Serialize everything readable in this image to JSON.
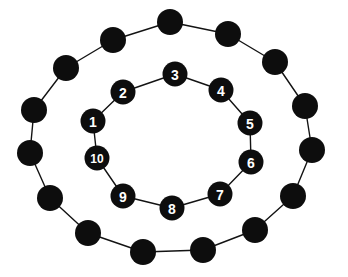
{
  "figure": {
    "background_color": "#ffffff",
    "node_color": "#0d0d0d",
    "edge_color": "#131313",
    "label_color": "#ffffff",
    "width": 348,
    "height": 277
  },
  "chart_data": {
    "type": "diagram",
    "subtype": "node-link-graph",
    "title": "",
    "rings": [
      {
        "name": "outer-ring",
        "node_count": 16,
        "labeled": false,
        "node_radius": 13,
        "center": [
          174,
          138
        ],
        "radius_x": 146,
        "radius_y": 118
      },
      {
        "name": "inner-ring",
        "node_count": 10,
        "labeled": true,
        "node_radius": 12.5,
        "center": [
          172,
          140
        ],
        "radius_x": 82,
        "radius_y": 68
      }
    ],
    "outer_nodes": [
      {
        "id": "o1",
        "label": "",
        "cx": 170,
        "cy": 22
      },
      {
        "id": "o2",
        "label": "",
        "cx": 228,
        "cy": 34
      },
      {
        "id": "o3",
        "label": "",
        "cx": 275,
        "cy": 62
      },
      {
        "id": "o4",
        "label": "",
        "cx": 305,
        "cy": 106
      },
      {
        "id": "o5",
        "label": "",
        "cx": 312,
        "cy": 150
      },
      {
        "id": "o6",
        "label": "",
        "cx": 293,
        "cy": 196
      },
      {
        "id": "o7",
        "label": "",
        "cx": 255,
        "cy": 230
      },
      {
        "id": "o8",
        "label": "",
        "cx": 203,
        "cy": 250
      },
      {
        "id": "o9",
        "label": "",
        "cx": 143,
        "cy": 252
      },
      {
        "id": "o10",
        "label": "",
        "cx": 88,
        "cy": 233
      },
      {
        "id": "o11",
        "label": "",
        "cx": 50,
        "cy": 198
      },
      {
        "id": "o12",
        "label": "",
        "cx": 30,
        "cy": 153
      },
      {
        "id": "o13",
        "label": "",
        "cx": 34,
        "cy": 110
      },
      {
        "id": "o14",
        "label": "",
        "cx": 66,
        "cy": 68
      },
      {
        "id": "o15",
        "label": "",
        "cx": 113,
        "cy": 40
      },
      {
        "id": "o16",
        "label": "",
        "cx": 170,
        "cy": 22
      }
    ],
    "inner_nodes": [
      {
        "id": "i1",
        "label": "1",
        "cx": 93,
        "cy": 121
      },
      {
        "id": "i2",
        "label": "2",
        "cx": 123,
        "cy": 92
      },
      {
        "id": "i3",
        "label": "3",
        "cx": 175,
        "cy": 74
      },
      {
        "id": "i4",
        "label": "4",
        "cx": 221,
        "cy": 90
      },
      {
        "id": "i5",
        "label": "5",
        "cx": 250,
        "cy": 123
      },
      {
        "id": "i6",
        "label": "6",
        "cx": 251,
        "cy": 162
      },
      {
        "id": "i7",
        "label": "7",
        "cx": 220,
        "cy": 194
      },
      {
        "id": "i8",
        "label": "8",
        "cx": 172,
        "cy": 208
      },
      {
        "id": "i9",
        "label": "9",
        "cx": 123,
        "cy": 196
      },
      {
        "id": "i10",
        "label": "10",
        "cx": 97,
        "cy": 158
      }
    ],
    "outer_edges": [
      [
        "o1",
        "o2"
      ],
      [
        "o2",
        "o3"
      ],
      [
        "o3",
        "o4"
      ],
      [
        "o4",
        "o5"
      ],
      [
        "o5",
        "o6"
      ],
      [
        "o6",
        "o7"
      ],
      [
        "o7",
        "o8"
      ],
      [
        "o8",
        "o9"
      ],
      [
        "o9",
        "o10"
      ],
      [
        "o10",
        "o11"
      ],
      [
        "o11",
        "o12"
      ],
      [
        "o12",
        "o13"
      ],
      [
        "o13",
        "o14"
      ],
      [
        "o14",
        "o15"
      ],
      [
        "o15",
        "o1"
      ]
    ],
    "inner_edges": [
      [
        "i1",
        "i2"
      ],
      [
        "i2",
        "i3"
      ],
      [
        "i3",
        "i4"
      ],
      [
        "i4",
        "i5"
      ],
      [
        "i5",
        "i6"
      ],
      [
        "i6",
        "i7"
      ],
      [
        "i7",
        "i8"
      ],
      [
        "i8",
        "i9"
      ],
      [
        "i9",
        "i10"
      ],
      [
        "i10",
        "i1"
      ]
    ],
    "inner_labels": [
      "1",
      "2",
      "3",
      "4",
      "5",
      "6",
      "7",
      "8",
      "9",
      "10"
    ],
    "label_font_size": 14,
    "label_font_size_wide": 12
  }
}
